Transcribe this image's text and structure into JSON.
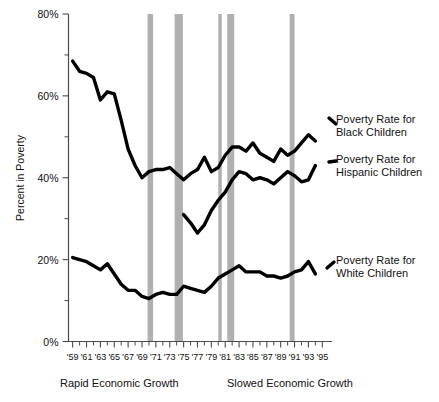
{
  "chart_data": {
    "type": "line",
    "title": "",
    "xlabel": "",
    "ylabel": "Percent in Poverty",
    "ylim": [
      0,
      80
    ],
    "xlim": [
      1959,
      1996
    ],
    "grid": false,
    "legend_position": "right-inline",
    "ytick_labels": [
      "0%",
      "20%",
      "40%",
      "60%",
      "80%"
    ],
    "ytick_values": [
      0,
      20,
      40,
      60,
      80
    ],
    "yminor_values": [
      10,
      30,
      50,
      70
    ],
    "xtick_labels": [
      "'59",
      "'61",
      "'63",
      "'65",
      "'67",
      "'69",
      "'71",
      "'73",
      "'75",
      "'77",
      "'79",
      "'81",
      "'83",
      "'85",
      "'87",
      "'89",
      "'91",
      "'93",
      "'95"
    ],
    "xtick_values": [
      1959,
      1961,
      1963,
      1965,
      1967,
      1969,
      1971,
      1973,
      1975,
      1977,
      1979,
      1981,
      1983,
      1985,
      1987,
      1989,
      1991,
      1993,
      1995
    ],
    "x": [
      1959,
      1960,
      1961,
      1962,
      1963,
      1964,
      1965,
      1966,
      1967,
      1968,
      1969,
      1970,
      1971,
      1972,
      1973,
      1974,
      1975,
      1976,
      1977,
      1978,
      1979,
      1980,
      1981,
      1982,
      1983,
      1984,
      1985,
      1986,
      1987,
      1988,
      1989,
      1990,
      1991,
      1992,
      1993,
      1994
    ],
    "series": [
      {
        "name": "Poverty Rate for Black Children",
        "label_line1": "Poverty Rate for",
        "label_line2": "Black Children",
        "color": "#000000",
        "x": [
          1959,
          1960,
          1961,
          1962,
          1963,
          1964,
          1965,
          1966,
          1967,
          1968,
          1969,
          1970,
          1971,
          1972,
          1973,
          1974,
          1975,
          1976,
          1977,
          1978,
          1979,
          1980,
          1981,
          1982,
          1983,
          1984,
          1985,
          1986,
          1987,
          1988,
          1989,
          1990,
          1991,
          1992,
          1993,
          1994
        ],
        "values": [
          68.5,
          66.0,
          65.5,
          64.5,
          59.0,
          61.0,
          60.5,
          54.0,
          47.0,
          43.0,
          40.0,
          41.5,
          42.0,
          42.0,
          42.5,
          41.0,
          39.5,
          41.0,
          42.0,
          45.0,
          41.5,
          42.5,
          45.5,
          47.5,
          47.5,
          46.5,
          48.5,
          46.0,
          45.0,
          44.0,
          47.0,
          45.5,
          46.5,
          48.5,
          50.5,
          49.0
        ]
      },
      {
        "name": "Poverty Rate for Hispanic Children",
        "label_line1": "Poverty Rate for",
        "label_line2": "Hispanic Children",
        "color": "#000000",
        "x": [
          1975,
          1976,
          1977,
          1978,
          1979,
          1980,
          1981,
          1982,
          1983,
          1984,
          1985,
          1986,
          1987,
          1988,
          1989,
          1990,
          1991,
          1992,
          1993,
          1994
        ],
        "values": [
          31.0,
          29.0,
          26.5,
          28.5,
          32.0,
          34.5,
          36.5,
          39.5,
          41.5,
          41.0,
          39.5,
          40.0,
          39.5,
          38.5,
          40.0,
          41.5,
          40.5,
          39.0,
          39.5,
          43.0
        ]
      },
      {
        "name": "Poverty Rate for White Children",
        "label_line1": "Poverty Rate for",
        "label_line2": "White Children",
        "color": "#000000",
        "x": [
          1959,
          1960,
          1961,
          1962,
          1963,
          1964,
          1965,
          1966,
          1967,
          1968,
          1969,
          1970,
          1971,
          1972,
          1973,
          1974,
          1975,
          1976,
          1977,
          1978,
          1979,
          1980,
          1981,
          1982,
          1983,
          1984,
          1985,
          1986,
          1987,
          1988,
          1989,
          1990,
          1991,
          1992,
          1993,
          1994
        ],
        "values": [
          20.5,
          20.0,
          19.5,
          18.5,
          17.5,
          19.0,
          16.5,
          14.0,
          12.5,
          12.5,
          11.0,
          10.5,
          11.5,
          12.0,
          11.5,
          11.5,
          13.5,
          13.0,
          12.5,
          12.0,
          13.5,
          15.5,
          16.5,
          17.5,
          18.5,
          17.0,
          17.0,
          17.0,
          16.0,
          16.0,
          15.5,
          16.0,
          17.0,
          17.5,
          19.5,
          16.5
        ]
      }
    ],
    "recession_bands": [
      {
        "start": 1969.8,
        "end": 1970.6,
        "label": "recession-1970"
      },
      {
        "start": 1973.7,
        "end": 1974.9,
        "label": "recession-1974"
      },
      {
        "start": 1980.0,
        "end": 1980.4,
        "label": "recession-1980"
      },
      {
        "start": 1981.3,
        "end": 1982.3,
        "label": "recession-1981"
      },
      {
        "start": 1990.3,
        "end": 1991.0,
        "label": "recession-1990"
      }
    ],
    "annotations": [
      {
        "text": "Rapid Economic Growth",
        "position": "bottom-left"
      },
      {
        "text": "Slowed Economic Growth",
        "position": "bottom-right"
      }
    ]
  }
}
